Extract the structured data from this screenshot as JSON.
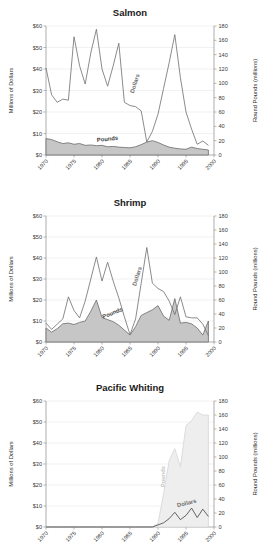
{
  "figure": {
    "background": "#ffffff",
    "axis_color": "#8a8a8a",
    "grid_color": "#e2e2e2",
    "dollars_color": "#767676",
    "pounds_fill": "#c6c6c6",
    "pounds_stroke": "#6b6b6b",
    "pounds_faint_fill": "#eeeeee",
    "pounds_faint_stroke": "#d6d6d6"
  },
  "shared": {
    "ylabel_left": "Millions of Dollars",
    "ylabel_right": "Round Pounds (millions)",
    "y_left_ticks": [
      "$0",
      "$10",
      "$20",
      "$30",
      "$40",
      "$50",
      "$60"
    ],
    "y_right_ticks": [
      "0",
      "20",
      "40",
      "60",
      "80",
      "100",
      "120",
      "140",
      "160",
      "180"
    ],
    "x_ticks": [
      "1970",
      "1975",
      "1980",
      "1985",
      "1990",
      "1995",
      "2000"
    ],
    "series_names": [
      "Dollars",
      "Pounds"
    ]
  },
  "chart_data": [
    {
      "type": "line",
      "title": "Salmon",
      "xlabel": "",
      "ylabel": "Millions of Dollars",
      "ylabel2": "Round Pounds (millions)",
      "xlim": [
        1970,
        2000
      ],
      "ylim": [
        0,
        60
      ],
      "ylim2": [
        0,
        180
      ],
      "grid": true,
      "legend": "inline-annotations",
      "x": [
        1970,
        1971,
        1972,
        1973,
        1974,
        1975,
        1976,
        1977,
        1978,
        1979,
        1980,
        1981,
        1982,
        1983,
        1984,
        1985,
        1986,
        1987,
        1988,
        1989,
        1990,
        1991,
        1992,
        1993,
        1994,
        1995,
        1996,
        1997,
        1998,
        1999
      ],
      "series": [
        {
          "name": "Dollars",
          "axis": "left",
          "unit": "millions of dollars",
          "values": [
            40.5,
            28.0,
            24.5,
            26.0,
            25.5,
            55.0,
            41.5,
            33.0,
            47.5,
            58.5,
            40.0,
            32.0,
            41.5,
            52.0,
            24.5,
            23.0,
            22.5,
            20.5,
            6.0,
            11.0,
            19.0,
            31.0,
            43.0,
            56.0,
            36.0,
            20.0,
            12.0,
            5.0,
            6.5,
            4.5
          ]
        },
        {
          "name": "Pounds",
          "axis": "right",
          "unit": "round pounds (millions)",
          "values": [
            23.0,
            21.5,
            18.5,
            16.0,
            17.0,
            15.0,
            16.0,
            13.5,
            14.0,
            13.0,
            13.5,
            11.5,
            12.0,
            11.0,
            10.5,
            10.0,
            11.5,
            14.5,
            18.0,
            20.0,
            17.5,
            14.0,
            11.0,
            9.5,
            8.5,
            8.0,
            11.0,
            9.0,
            8.0,
            7.0
          ]
        }
      ]
    },
    {
      "type": "line",
      "title": "Shrimp",
      "xlabel": "",
      "ylabel": "Millions of Dollars",
      "ylabel2": "Round Pounds (millions)",
      "xlim": [
        1970,
        2000
      ],
      "ylim": [
        0,
        60
      ],
      "ylim2": [
        0,
        180
      ],
      "grid": true,
      "legend": "inline-annotations",
      "x": [
        1970,
        1971,
        1972,
        1973,
        1974,
        1975,
        1976,
        1977,
        1978,
        1979,
        1980,
        1981,
        1982,
        1983,
        1984,
        1985,
        1986,
        1987,
        1988,
        1989,
        1990,
        1991,
        1992,
        1993,
        1994,
        1995,
        1996,
        1997,
        1998,
        1999
      ],
      "series": [
        {
          "name": "Dollars",
          "axis": "left",
          "unit": "millions of dollars",
          "values": [
            9.0,
            6.0,
            8.5,
            11.0,
            21.5,
            15.0,
            11.5,
            19.5,
            30.0,
            40.5,
            29.0,
            38.0,
            29.0,
            21.0,
            12.0,
            3.5,
            11.0,
            28.0,
            45.0,
            28.0,
            25.5,
            24.0,
            19.5,
            13.0,
            21.5,
            12.0,
            11.5,
            11.5,
            8.5,
            3.0
          ]
        },
        {
          "name": "Pounds",
          "axis": "right",
          "unit": "round pounds (millions)",
          "values": [
            20.0,
            14.0,
            19.0,
            26.0,
            27.0,
            25.0,
            28.0,
            30.0,
            44.0,
            60.0,
            35.0,
            32.0,
            29.0,
            24.0,
            17.0,
            10.0,
            22.0,
            38.0,
            42.0,
            46.0,
            52.0,
            37.0,
            31.0,
            62.0,
            27.0,
            28.0,
            26.0,
            20.0,
            10.0,
            30.0
          ]
        }
      ]
    },
    {
      "type": "line",
      "title": "Pacific Whiting",
      "xlabel": "",
      "ylabel": "Millions of Dollars",
      "ylabel2": "Round Pounds (millions)",
      "xlim": [
        1970,
        2000
      ],
      "ylim": [
        0,
        60
      ],
      "ylim2": [
        0,
        180
      ],
      "grid": true,
      "legend": "inline-annotations",
      "x": [
        1970,
        1971,
        1972,
        1973,
        1974,
        1975,
        1976,
        1977,
        1978,
        1979,
        1980,
        1981,
        1982,
        1983,
        1984,
        1985,
        1986,
        1987,
        1988,
        1989,
        1990,
        1991,
        1992,
        1993,
        1994,
        1995,
        1996,
        1997,
        1998,
        1999
      ],
      "series": [
        {
          "name": "Dollars",
          "axis": "left",
          "unit": "millions of dollars",
          "values": [
            0,
            0,
            0,
            0,
            0,
            0,
            0,
            0,
            0,
            0,
            0,
            0,
            0,
            0,
            0,
            0,
            0,
            0,
            0,
            0,
            1.0,
            2.0,
            4.0,
            7.0,
            3.5,
            5.5,
            9.0,
            4.5,
            8.5,
            5.0
          ]
        },
        {
          "name": "Pounds",
          "axis": "right",
          "unit": "round pounds (millions)",
          "values": [
            0,
            0,
            0,
            0,
            0,
            0,
            0,
            0,
            0,
            0,
            0,
            0,
            0,
            0,
            0,
            0,
            0,
            0,
            0,
            0,
            5.0,
            48.0,
            95.0,
            112.0,
            86.0,
            145.0,
            152.0,
            164.0,
            160.0,
            160.0
          ]
        }
      ]
    }
  ],
  "annotations": {
    "salmon": [
      {
        "text": "Dollars",
        "x": 1986.2,
        "yval": 33,
        "axis": "left",
        "rotate": -72,
        "tone": "light"
      },
      {
        "text": "Pounds",
        "x": 1981.0,
        "yval": 6.6,
        "axis": "left",
        "rotate": -6,
        "tone": "dark"
      }
    ],
    "shrimp": [
      {
        "text": "Dollars",
        "x": 1986.6,
        "yval": 31,
        "axis": "left",
        "rotate": -72,
        "tone": "light"
      },
      {
        "text": "Pounds",
        "x": 1982.0,
        "yval": 13.0,
        "axis": "left",
        "rotate": -22,
        "tone": "dark"
      }
    ],
    "whiting": [
      {
        "text": "Pounds",
        "x": 1991.2,
        "yval": 24,
        "axis": "left",
        "rotate": -90,
        "tone": "faint"
      },
      {
        "text": "Dollars",
        "x": 1995.2,
        "yval": 10.5,
        "axis": "left",
        "rotate": -14,
        "tone": "light"
      }
    ]
  }
}
